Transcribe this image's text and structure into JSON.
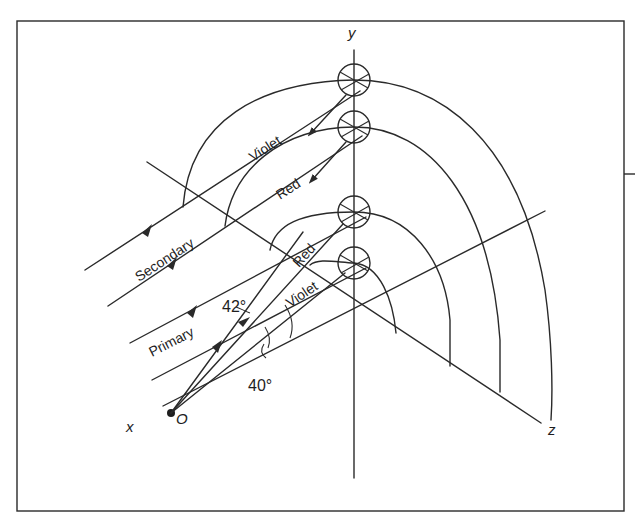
{
  "diagram": {
    "axes": {
      "x": "x",
      "y": "y",
      "z": "z",
      "observer": "O"
    },
    "ray_labels": {
      "secondary": "Secondary",
      "primary": "Primary"
    },
    "color_labels": {
      "secondary_violet": "Violet",
      "secondary_red": "Red",
      "primary_red": "Red",
      "primary_violet": "Violet"
    },
    "angles": {
      "primary_angle": "42°",
      "secondary_angle": "40°"
    },
    "droplets": [
      {
        "name": "top-droplet",
        "color": "Violet (secondary)"
      },
      {
        "name": "second-droplet",
        "color": "Red (secondary)"
      },
      {
        "name": "third-droplet",
        "color": "Red (primary)"
      },
      {
        "name": "fourth-droplet",
        "color": "Violet (primary)"
      }
    ],
    "colors": {
      "ink": "#2a2a2a",
      "background": "#ffffff"
    }
  }
}
